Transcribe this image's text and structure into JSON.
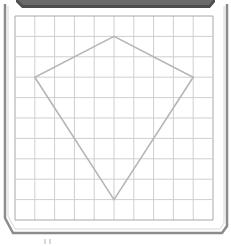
{
  "diagram": {
    "type": "grid-with-kite",
    "grid": {
      "columns": 10,
      "rows": 10,
      "x0": 15,
      "y0": 16,
      "x1": 213,
      "y1": 220,
      "line_color": "#cfcfcf",
      "border_color": "#a8a8a8"
    },
    "shape": {
      "name": "kite",
      "stroke_color": "#b5b5b5",
      "vertices_grid": [
        [
          5,
          1
        ],
        [
          1,
          3
        ],
        [
          5,
          9
        ],
        [
          9,
          3
        ]
      ],
      "vertices_px": [
        [
          115,
          37
        ],
        [
          36,
          78
        ],
        [
          115,
          199
        ],
        [
          193,
          78
        ]
      ]
    },
    "frame": {
      "top_bar_color": "#5a5a5a",
      "border_color": "#8a8a8a",
      "background": "#ffffff"
    }
  }
}
